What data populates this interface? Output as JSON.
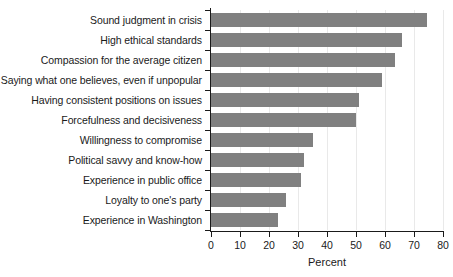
{
  "chart_data": {
    "type": "bar",
    "orientation": "horizontal",
    "title": "",
    "xlabel": "Percent",
    "ylabel": "",
    "xlim": [
      0,
      80
    ],
    "ylim": null,
    "xticks": [
      0,
      10,
      20,
      30,
      40,
      50,
      60,
      70,
      80
    ],
    "grid": "vertical-major-only",
    "legend": "none",
    "bar_color": "#808080",
    "axis_color": "#1a1a1a",
    "gridline_color": "#e9e9e9",
    "categories": [
      "Sound judgment in crisis",
      "High ethical standards",
      "Compassion for the average citizen",
      "Saying what one believes, even if unpopular",
      "Having consistent positions on issues",
      "Forcefulness and decisiveness",
      "Willingness to compromise",
      "Political savvy and know-how",
      "Experience in public office",
      "Loyalty to one's party",
      "Experience in Washington"
    ],
    "values": [
      74.5,
      66,
      63.5,
      59,
      51,
      50,
      35,
      32,
      31,
      26,
      23
    ]
  }
}
